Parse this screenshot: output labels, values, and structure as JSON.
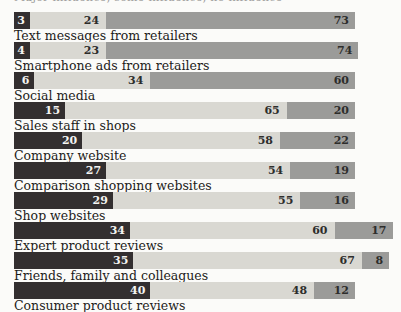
{
  "header": {
    "clipped_text": "Major influence, some influence, no influence"
  },
  "colors": {
    "segment_dark": "#332f30",
    "segment_light": "#d9d8d2",
    "segment_gray": "#9b9b99",
    "background": "#fbfbf9",
    "value_text_on_dark": "#f4f4f2",
    "value_text_on_light": "#2d2d2b"
  },
  "chart_data": {
    "type": "bar",
    "orientation": "horizontal",
    "stacked": true,
    "unit": "%",
    "title": "",
    "xlabel": "",
    "ylabel": "",
    "xlim": [
      0,
      111
    ],
    "grid": false,
    "legend_position": "top-clipped",
    "categories": [
      "Text messages from retailers",
      "Smartphone ads from retailers",
      "Social media",
      "Sales staff in shops",
      "Company website",
      "Comparison shopping websites",
      "Shop websites",
      "Expert product reviews",
      "Friends, family and colleagues",
      "Consumer product reviews"
    ],
    "series": [
      {
        "name": "dark-left-segment",
        "color": "#332f30",
        "values": [
          3,
          4,
          6,
          15,
          20,
          27,
          29,
          34,
          35,
          40
        ]
      },
      {
        "name": "light-mid-segment",
        "color": "#d9d8d2",
        "values": [
          24,
          23,
          34,
          65,
          58,
          54,
          55,
          60,
          67,
          48
        ]
      },
      {
        "name": "gray-right-segment",
        "color": "#9b9b99",
        "values": [
          73,
          74,
          60,
          20,
          22,
          19,
          16,
          17,
          8,
          12
        ]
      }
    ]
  }
}
